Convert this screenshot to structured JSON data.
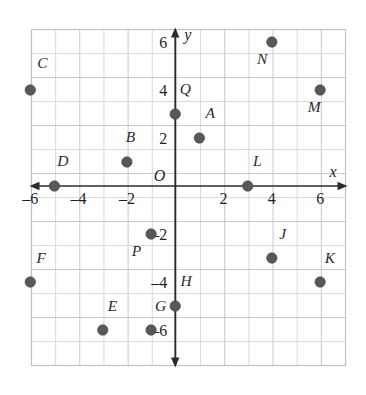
{
  "chart_data": {
    "type": "scatter",
    "title": "",
    "xlabel": "x",
    "ylabel": "y",
    "origin_label": "O",
    "grid": true,
    "xlim": [
      -7,
      7
    ],
    "ylim": [
      -7,
      7
    ],
    "xticks": [
      -6,
      -4,
      -2,
      2,
      4,
      6
    ],
    "yticks": [
      6,
      4,
      2,
      -2,
      -4,
      -6
    ],
    "xtick_labels": [
      "-6",
      "-4",
      "-2",
      "2",
      "4",
      "6"
    ],
    "ytick_labels": [
      "6",
      "4",
      "2",
      "-2",
      "-4",
      "-6"
    ],
    "point_color": "#585858",
    "grid_color": "#c8c8cc",
    "axis_color": "#2b2b2b",
    "points": [
      {
        "label": "A",
        "x": 1,
        "y": 2,
        "lx": 1.45,
        "ly": 2.85
      },
      {
        "label": "B",
        "x": -2,
        "y": 1,
        "lx": -1.85,
        "ly": 1.85
      },
      {
        "label": "C",
        "x": -6,
        "y": 4,
        "lx": -5.5,
        "ly": 4.9
      },
      {
        "label": "D",
        "x": -5,
        "y": 0,
        "lx": -4.65,
        "ly": 0.85
      },
      {
        "label": "E",
        "x": -3,
        "y": -6,
        "lx": -2.6,
        "ly": -5.2
      },
      {
        "label": "F",
        "x": -6,
        "y": -4,
        "lx": -5.55,
        "ly": -3.2
      },
      {
        "label": "G",
        "x": -1,
        "y": -6,
        "lx": -0.6,
        "ly": -5.2
      },
      {
        "label": "H",
        "x": 0,
        "y": -5,
        "lx": 0.45,
        "ly": -4.15
      },
      {
        "label": "J",
        "x": 4,
        "y": -3,
        "lx": 4.45,
        "ly": -2.2
      },
      {
        "label": "K",
        "x": 6,
        "y": -4,
        "lx": 6.4,
        "ly": -3.2
      },
      {
        "label": "L",
        "x": 3,
        "y": 0,
        "lx": 3.4,
        "ly": 0.85
      },
      {
        "label": "M",
        "x": 6,
        "y": 4,
        "lx": 5.75,
        "ly": 3.1
      },
      {
        "label": "N",
        "x": 4,
        "y": 6,
        "lx": 3.6,
        "ly": 5.1
      },
      {
        "label": "P",
        "x": -1,
        "y": -2,
        "lx": -1.6,
        "ly": -2.9
      },
      {
        "label": "Q",
        "x": 0,
        "y": 3,
        "lx": 0.42,
        "ly": 3.85
      }
    ]
  }
}
